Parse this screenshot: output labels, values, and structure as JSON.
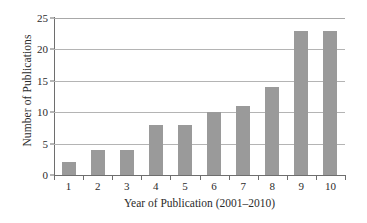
{
  "chart_data": {
    "type": "bar",
    "title": "",
    "xlabel": "Year of Publication (2001–2010)",
    "ylabel": "Number of Publications",
    "categories": [
      "1",
      "2",
      "3",
      "4",
      "5",
      "6",
      "7",
      "8",
      "9",
      "10"
    ],
    "values": [
      2,
      4,
      4,
      8,
      8,
      10,
      11,
      14,
      23,
      23
    ],
    "ylim": [
      0,
      25
    ],
    "yticks": [
      0,
      5,
      10,
      15,
      20,
      25
    ],
    "ytick_labels": [
      "0",
      "5",
      "10",
      "15",
      "20",
      "25"
    ],
    "grid": "horizontal",
    "legend": "none",
    "bar_color": "#9a9a9a",
    "gridline_color": "#b4b4b4",
    "axis_color": "#6e6e6e",
    "background_color": "#ffffff"
  }
}
